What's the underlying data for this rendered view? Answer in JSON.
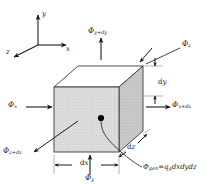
{
  "figure": {
    "type": "diagram"
  },
  "axes": {
    "x_label": "x",
    "y_label": "y",
    "z_label": "z"
  },
  "cube": {
    "front_face_fill": "#dcdcdc",
    "right_face_fill": "#c9c9c9",
    "top_face_fill": "#ffffff",
    "edge_color": "#3a3a3a",
    "center_point_color": "#000000"
  },
  "flux_labels": {
    "top": {
      "symbol": "Φ",
      "subscript": "y+dy"
    },
    "left": {
      "symbol": "Φ",
      "subscript": "x"
    },
    "right": {
      "symbol": "Φ",
      "subscript": "x+dx"
    },
    "bottom": {
      "symbol": "Φ",
      "subscript": "y"
    },
    "back": {
      "symbol": "Φ",
      "subscript": "z"
    },
    "front": {
      "symbol": "Φ",
      "subscript": "z+dz"
    }
  },
  "dimensions": {
    "dx": "dx",
    "dy": "dy",
    "dz": "dz"
  },
  "generation": {
    "symbol": "Φ",
    "subscript": "gen",
    "equals": "=",
    "rhs_q": "q",
    "rhs_q_sub": "g",
    "rhs_vol": "dxdydz"
  }
}
